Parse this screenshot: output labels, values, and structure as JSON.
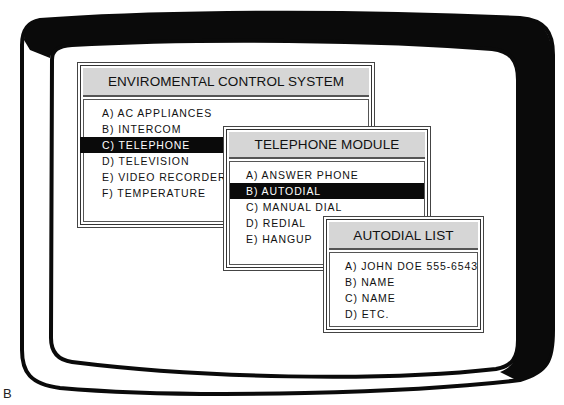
{
  "figure_label": "B",
  "colors": {
    "bezel": "#0a0a0a",
    "screen": "#ffffff",
    "header_fill": "#d6d6d6",
    "selected_fill": "#0a0a0a",
    "selected_text": "#ffffff"
  },
  "windows": [
    {
      "title": "ENVIROMENTAL CONTROL SYSTEM",
      "items": [
        {
          "key": "A)",
          "label": "AC  APPLIANCES",
          "selected": false
        },
        {
          "key": "B)",
          "label": "INTERCOM",
          "selected": false
        },
        {
          "key": "C)",
          "label": "TELEPHONE",
          "selected": true
        },
        {
          "key": "D)",
          "label": "TELEVISION",
          "selected": false
        },
        {
          "key": "E)",
          "label": "VIDEO  RECORDER",
          "selected": false
        },
        {
          "key": "F)",
          "label": "TEMPERATURE",
          "selected": false
        }
      ]
    },
    {
      "title": "TELEPHONE MODULE",
      "items": [
        {
          "key": "A)",
          "label": "ANSWER  PHONE",
          "selected": false
        },
        {
          "key": "B)",
          "label": "AUTODIAL",
          "selected": true
        },
        {
          "key": "C)",
          "label": "MANUAL  DIAL",
          "selected": false
        },
        {
          "key": "D)",
          "label": "REDIAL",
          "selected": false
        },
        {
          "key": "E)",
          "label": "HANGUP",
          "selected": false
        }
      ]
    },
    {
      "title": "AUTODIAL LIST",
      "items": [
        {
          "key": "A)",
          "label": "JOHN  DOE  555-6543",
          "selected": false
        },
        {
          "key": "B)",
          "label": "NAME",
          "selected": false
        },
        {
          "key": "C)",
          "label": "NAME",
          "selected": false
        },
        {
          "key": "D)",
          "label": "ETC.",
          "selected": false
        }
      ]
    }
  ]
}
